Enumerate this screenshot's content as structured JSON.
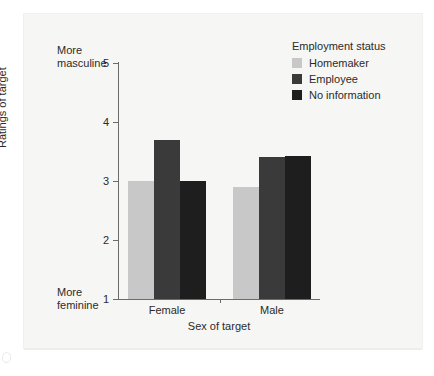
{
  "chart_data": {
    "type": "bar",
    "title": "",
    "xlabel": "Sex of target",
    "ylabel": "Ratings of target",
    "categories": [
      "Female",
      "Male"
    ],
    "series": [
      {
        "name": "Homemaker",
        "values": [
          3.0,
          2.9
        ],
        "color": "#c8c8c8"
      },
      {
        "name": "Employee",
        "values": [
          3.7,
          3.4
        ],
        "color": "#3a3a3a"
      },
      {
        "name": "No information",
        "values": [
          3.0,
          3.42
        ],
        "color": "#1e1e1e"
      }
    ],
    "ylim": [
      1,
      5
    ],
    "yticks": [
      1,
      2,
      3,
      4,
      5
    ],
    "ytick_labels": [
      "1",
      "2",
      "3",
      "4",
      "5"
    ],
    "grid": false,
    "legend_position": "top-right",
    "annotations": {
      "y_high_anchor": "More\nmasculine",
      "y_low_anchor": "More\nfeminine"
    }
  },
  "axis": {
    "y_label": "Ratings of target",
    "x_label": "Sex of target",
    "tick_5": "5",
    "tick_4": "4",
    "tick_3": "3",
    "tick_2": "2",
    "tick_1": "1",
    "cat_female": "Female",
    "cat_male": "Male"
  },
  "anchors": {
    "top_line1": "More",
    "top_line2": "masculine",
    "bottom_line1": "More",
    "bottom_line2": "feminine"
  },
  "legend": {
    "title": "Employment status",
    "items": [
      {
        "label": "Homemaker",
        "color": "#c8c8c8"
      },
      {
        "label": "Employee",
        "color": "#3a3a3a"
      },
      {
        "label": "No information",
        "color": "#1e1e1e"
      }
    ]
  }
}
